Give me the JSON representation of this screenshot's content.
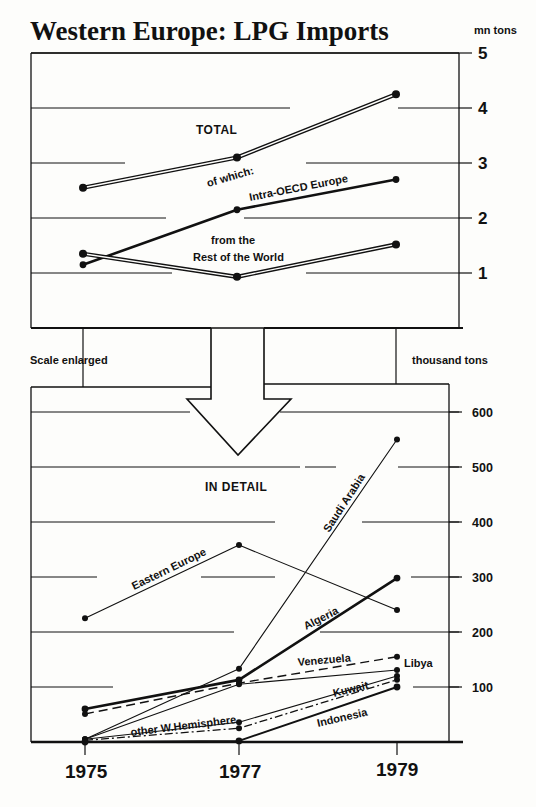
{
  "chart_data": [
    {
      "type": "line",
      "title": "Western Europe: LPG Imports",
      "panel_label": "TOTAL",
      "annotation": "of which:",
      "ylabel": "mn tons",
      "ylim": [
        0,
        5
      ],
      "yticks": [
        "1",
        "2",
        "3",
        "4",
        "5"
      ],
      "x": [
        "1975",
        "1977",
        "1979"
      ],
      "grid": true,
      "series": [
        {
          "name": "TOTAL",
          "label": "",
          "style": "double",
          "values": [
            2.55,
            3.1,
            4.25
          ]
        },
        {
          "name": "Intra-OECD Europe",
          "label": "Intra-OECD Europe",
          "style": "thick",
          "values": [
            1.15,
            2.15,
            2.7
          ]
        },
        {
          "name": "from the Rest of the World",
          "label_line1": "from the",
          "label_line2": "Rest of the World",
          "style": "double",
          "values": [
            1.35,
            0.93,
            1.52
          ]
        }
      ]
    },
    {
      "type": "line",
      "title": "IN DETAIL",
      "note_left": "Scale enlarged",
      "ylabel": "thousand tons",
      "ylim": [
        0,
        600
      ],
      "yticks": [
        "100",
        "200",
        "300",
        "400",
        "500",
        "600"
      ],
      "x": [
        "1975",
        "1977",
        "1979"
      ],
      "grid": true,
      "series": [
        {
          "name": "Saudi Arabia",
          "style": "thin",
          "values": [
            5,
            133,
            550
          ]
        },
        {
          "name": "Eastern Europe",
          "style": "thin",
          "values": [
            225,
            358,
            240
          ]
        },
        {
          "name": "Algeria",
          "style": "thick",
          "values": [
            60,
            113,
            298
          ]
        },
        {
          "name": "Venezuela",
          "style": "dashed",
          "values": [
            51,
            107,
            155
          ]
        },
        {
          "name": "Libya",
          "style": "thin",
          "values": [
            5,
            105,
            131
          ]
        },
        {
          "name": "other W.Hemisphere",
          "style": "thin",
          "values": [
            5,
            36,
            120
          ]
        },
        {
          "name": "Kuwait",
          "style": "dashdot",
          "values": [
            3,
            25,
            113
          ]
        },
        {
          "name": "Indonesia",
          "style": "medium",
          "values": [
            0,
            2,
            100
          ]
        }
      ]
    }
  ],
  "labels": {
    "title": "Western Europe: LPG Imports",
    "top_unit": "mn tons",
    "top_panel": "TOTAL",
    "of_which": "of which:",
    "intra_oecd": "Intra-OECD Europe",
    "row_line1": "from the",
    "row_line2": "Rest of the World",
    "scale_enlarged": "Scale enlarged",
    "bottom_unit": "thousand tons",
    "bottom_panel": "IN DETAIL",
    "saudi": "Saudi Arabia",
    "eastern_europe": "Eastern Europe",
    "algeria": "Algeria",
    "venezuela": "Venezuela",
    "libya": "Libya",
    "kuwait": "Kuwait",
    "other_wh": "other W.Hemisphere",
    "indonesia": "Indonesia",
    "top_ticks": [
      "5",
      "4",
      "3",
      "2",
      "1"
    ],
    "bottom_ticks": [
      "600",
      "500",
      "400",
      "300",
      "200",
      "100"
    ],
    "years": [
      "1975",
      "1977",
      "1979"
    ]
  },
  "colors": {
    "ink": "#111111",
    "paper": "#fdfdfb"
  }
}
